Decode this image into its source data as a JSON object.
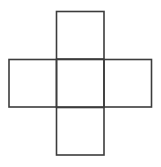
{
  "diagram": {
    "type": "cube-net-cross",
    "width": 161,
    "height": 167,
    "background": "#ffffff",
    "stroke_color": "#3c3c3c",
    "stroke_width": 1.6,
    "cell_size": 47.5,
    "squares": [
      {
        "name": "top-face",
        "x": 56.5,
        "y": 11.5
      },
      {
        "name": "left-face",
        "x": 9,
        "y": 59.5
      },
      {
        "name": "center-face",
        "x": 56.5,
        "y": 59.5
      },
      {
        "name": "right-face",
        "x": 104,
        "y": 59.5
      },
      {
        "name": "bottom-face",
        "x": 56.5,
        "y": 107.5
      }
    ]
  }
}
